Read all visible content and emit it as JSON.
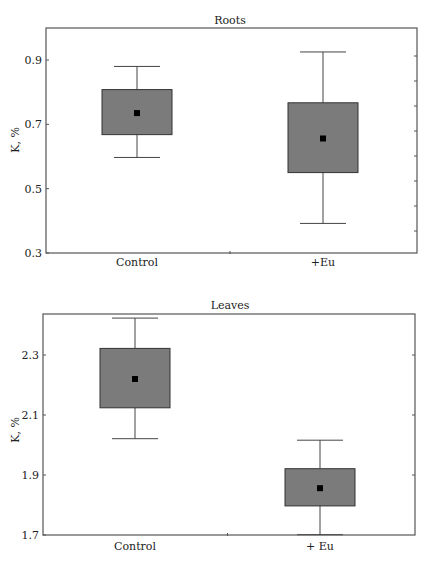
{
  "chart_data": [
    {
      "type": "box",
      "title": "Roots",
      "xlabel": "",
      "ylabel": "K, %",
      "ylim": [
        0.3,
        1.0
      ],
      "yticks": [
        0.3,
        0.5,
        0.7,
        0.9
      ],
      "ytick_labels": [
        "0.3",
        "0.5",
        "0.7",
        "0.9"
      ],
      "grid": false,
      "categories": [
        "Control",
        "+Eu"
      ],
      "series": [
        {
          "name": "Control",
          "mean": 0.735,
          "box_low": 0.668,
          "box_high": 0.808,
          "whisker_low": 0.597,
          "whisker_high": 0.88
        },
        {
          "name": "+Eu",
          "mean": 0.656,
          "box_low": 0.55,
          "box_high": 0.767,
          "whisker_low": 0.392,
          "whisker_high": 0.925
        }
      ]
    },
    {
      "type": "box",
      "title": "Leaves",
      "xlabel": "",
      "ylabel": "K, %",
      "ylim": [
        1.7,
        2.44
      ],
      "yticks": [
        1.7,
        1.9,
        2.1,
        2.3
      ],
      "ytick_labels": [
        "1.7",
        "1.9",
        "2.1",
        "2.3"
      ],
      "grid": false,
      "categories": [
        "Control",
        "+ Eu"
      ],
      "series": [
        {
          "name": "Control",
          "mean": 2.22,
          "box_low": 2.124,
          "box_high": 2.322,
          "whisker_low": 2.021,
          "whisker_high": 2.423
        },
        {
          "name": "+ Eu",
          "mean": 1.856,
          "box_low": 1.797,
          "box_high": 1.921,
          "whisker_low": 1.701,
          "whisker_high": 2.016
        }
      ]
    }
  ],
  "colors": {
    "box_fill": "#7b7b7b",
    "mean_marker": "#000000"
  }
}
